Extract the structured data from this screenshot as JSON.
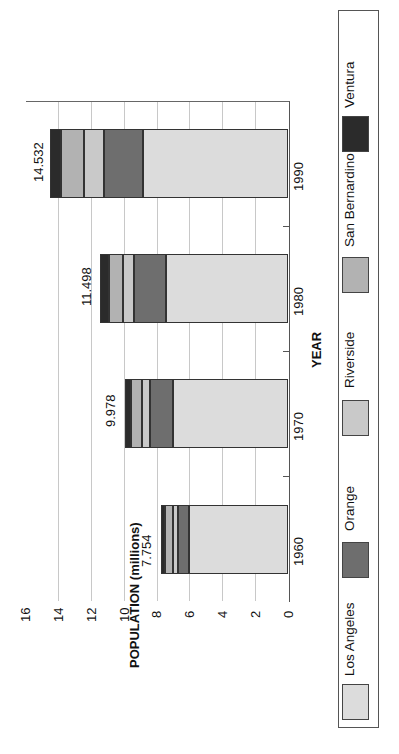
{
  "chart_data": {
    "type": "bar",
    "orientation": "stacked, rendered rotated 90° (bars extend leftward; text reads bottom-to-top)",
    "title": "",
    "xlabel": "YEAR",
    "ylabel": "POPULATION (millions)",
    "ylim": [
      0,
      16
    ],
    "yticks": [
      "0",
      "2",
      "4",
      "6",
      "8",
      "10",
      "12",
      "14",
      "16"
    ],
    "grid": true,
    "legend_position": "right (bottom of unrotated chart)",
    "categories": [
      "1960",
      "1970",
      "1980",
      "1990"
    ],
    "totals": [
      "7.754",
      "9.978",
      "11.498",
      "14.532"
    ],
    "series": [
      {
        "name": "Los Angeles",
        "color": "#dcdcdc",
        "values": [
          6.04,
          7.04,
          7.48,
          8.86
        ]
      },
      {
        "name": "Orange",
        "color": "#6e6e6e",
        "values": [
          0.7,
          1.42,
          1.93,
          2.41
        ]
      },
      {
        "name": "Riverside",
        "color": "#c9c9c9",
        "values": [
          0.31,
          0.46,
          0.66,
          1.17
        ]
      },
      {
        "name": "San Bernardino",
        "color": "#b2b2b2",
        "values": [
          0.5,
          0.68,
          0.9,
          1.42
        ]
      },
      {
        "name": "Ventura",
        "color": "#2b2b2b",
        "values": [
          0.2,
          0.38,
          0.53,
          0.67
        ]
      }
    ]
  },
  "axis": {
    "x_title": "YEAR",
    "y_title": "POPULATION (millions)"
  },
  "legend": {
    "items": [
      {
        "label": "Los Angeles"
      },
      {
        "label": "Orange"
      },
      {
        "label": "Riverside"
      },
      {
        "label": "San Bernardino"
      },
      {
        "label": "Ventura"
      }
    ]
  }
}
